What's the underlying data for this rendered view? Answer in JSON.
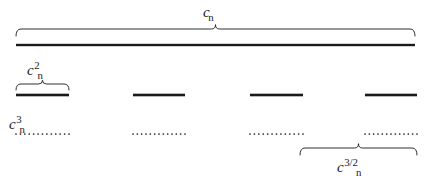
{
  "figure": {
    "background_color": "#ffffff",
    "stroke_color": "#1a1a1a",
    "width": 431,
    "height": 184
  },
  "labels": {
    "top_brace": {
      "base": "c",
      "subscript": "n",
      "superscript": "",
      "text": "c_n"
    },
    "second_brace": {
      "base": "c",
      "subscript": "n",
      "superscript": "2",
      "text": "c_n^2"
    },
    "dotted_row": {
      "base": "c",
      "subscript": "n",
      "superscript": "3",
      "text": "c_n^3"
    },
    "bottom_brace": {
      "base": "c",
      "subscript": "n",
      "superscript": "3/2",
      "text": "c_n^{3/2}"
    }
  },
  "geometry": {
    "top_brace": {
      "x1": 16,
      "x2": 415,
      "y": 29,
      "depth": 7
    },
    "top_bar": {
      "x1": 16,
      "x2": 415,
      "y": 45,
      "thickness": 2.4
    },
    "second_brace": {
      "x1": 16,
      "x2": 69,
      "y": 84,
      "depth": 6
    },
    "bottom_brace": {
      "x1": 300,
      "x2": 417,
      "y": 148,
      "depth": 7
    },
    "solid_segments": [
      {
        "x1": 16,
        "x2": 69,
        "y": 95
      },
      {
        "x1": 133,
        "x2": 185,
        "y": 95
      },
      {
        "x1": 250,
        "x2": 303,
        "y": 95
      },
      {
        "x1": 365,
        "x2": 417,
        "y": 95
      }
    ],
    "dotted_segments": [
      {
        "x1": 16,
        "x2": 69,
        "y": 134
      },
      {
        "x1": 133,
        "x2": 185,
        "y": 134
      },
      {
        "x1": 250,
        "x2": 303,
        "y": 134
      },
      {
        "x1": 365,
        "x2": 417,
        "y": 134
      }
    ],
    "dot_radius": 0.85,
    "dot_spacing": 4.1
  }
}
